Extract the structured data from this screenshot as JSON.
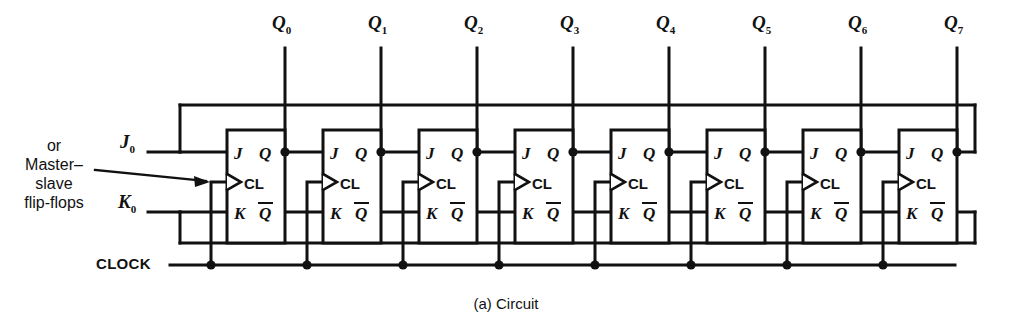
{
  "figure": {
    "caption": "(a)  Circuit",
    "annotation_lines": [
      "or",
      "Master–",
      "slave",
      "flip-flops"
    ],
    "clock_label": "CLOCK",
    "j_input_label": "J",
    "j_input_sub": "0",
    "k_input_label": "K",
    "k_input_sub": "0",
    "output_labels": [
      {
        "base": "Q",
        "sub": "0"
      },
      {
        "base": "Q",
        "sub": "1"
      },
      {
        "base": "Q",
        "sub": "2"
      },
      {
        "base": "Q",
        "sub": "3"
      },
      {
        "base": "Q",
        "sub": "4"
      },
      {
        "base": "Q",
        "sub": "5"
      },
      {
        "base": "Q",
        "sub": "6"
      },
      {
        "base": "Q",
        "sub": "7"
      }
    ],
    "flipflop": {
      "pin_j": "J",
      "pin_q": "Q",
      "pin_clock": "CL",
      "pin_k": "K",
      "pin_qbar": "Q"
    },
    "stage_count": 8,
    "colors": {
      "ink": "#111111",
      "background": "#ffffff"
    }
  }
}
